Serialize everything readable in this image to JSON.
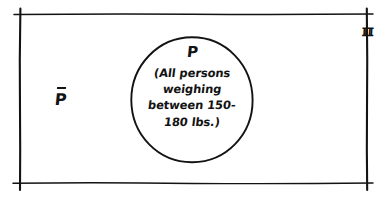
{
  "diagram": {
    "type": "venn-diagram",
    "universe": {
      "label": "ℼ",
      "label_meaning": "universal-set-fraktur-u",
      "position": "top-right"
    },
    "regions": [
      {
        "name": "complement-region",
        "label": "P",
        "overbar": true,
        "meaning": "complement-of-P",
        "position": "left-inside-rectangle"
      },
      {
        "name": "set-p-region",
        "label": "P",
        "shape": "circle",
        "description_lines": [
          "(All persons",
          "weighing",
          "between 150-",
          "180 lbs.)"
        ]
      }
    ],
    "colors": {
      "ink": "#131313",
      "background": "#ffffff"
    }
  }
}
